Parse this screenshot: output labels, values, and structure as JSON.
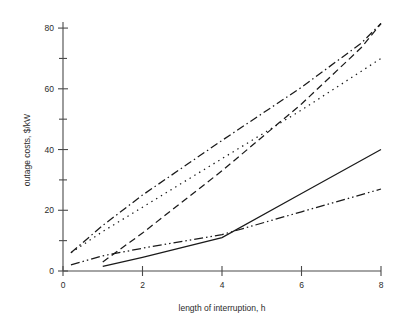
{
  "chart_data": {
    "type": "line",
    "title": "",
    "xlabel": "length of interruption, h",
    "ylabel": "outage costs, $/kW",
    "xlim": [
      0,
      8
    ],
    "ylim": [
      0,
      82
    ],
    "grid": false,
    "legend_position": "none",
    "x_ticks_major": [
      0,
      2,
      4,
      6,
      8
    ],
    "x_tick_labels": [
      "0",
      "2",
      "4",
      "6",
      "8"
    ],
    "x_ticks_minor": [
      1,
      3,
      5,
      7
    ],
    "y_ticks_major": [
      0,
      20,
      40,
      60,
      80
    ],
    "y_tick_labels": [
      "0",
      "20",
      "40",
      "60",
      "80"
    ],
    "y_ticks_minor": [
      10,
      30,
      50,
      70
    ],
    "series": [
      {
        "name": "dash-dot curve",
        "style": "dashdot",
        "x": [
          0.2,
          1.0,
          2.0,
          4.0,
          6.0,
          7.5,
          8.0
        ],
        "values": [
          6.0,
          15.0,
          25.0,
          43.0,
          60.5,
          75.0,
          81.5
        ]
      },
      {
        "name": "dashed curve",
        "style": "dashed",
        "x": [
          1.0,
          2.0,
          4.0,
          6.0,
          7.5,
          8.0
        ],
        "values": [
          3.0,
          12.5,
          33.0,
          55.0,
          73.5,
          81.5
        ]
      },
      {
        "name": "dotted curve",
        "style": "dotted",
        "x": [
          0.2,
          1.0,
          2.0,
          4.0,
          6.0,
          8.0
        ],
        "values": [
          6.0,
          13.0,
          21.0,
          37.0,
          53.0,
          70.0
        ]
      },
      {
        "name": "solid curve",
        "style": "solid",
        "x": [
          1.0,
          2.0,
          4.0,
          6.0,
          8.0
        ],
        "values": [
          1.5,
          4.5,
          11.0,
          25.5,
          40.0
        ]
      },
      {
        "name": "dash-dot-dot curve",
        "style": "dashdotdot",
        "x": [
          0.2,
          1.0,
          2.0,
          4.0,
          6.0,
          8.0
        ],
        "values": [
          2.0,
          5.0,
          7.5,
          12.0,
          19.5,
          27.0
        ]
      }
    ]
  }
}
